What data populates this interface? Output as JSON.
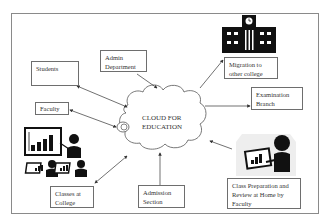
{
  "diagram": {
    "center": {
      "label_line1": "CLOUD FOR",
      "label_line2": "EDUCATION"
    },
    "nodes": {
      "students": {
        "label": "Students"
      },
      "admin": {
        "line1": "Admin",
        "line2": "Department"
      },
      "faculty": {
        "label": "Faculty"
      },
      "migration": {
        "line1": "Migration to",
        "line2": "other college"
      },
      "examination": {
        "line1": "Examination",
        "line2": "Branch"
      },
      "classes": {
        "line1": "Classes at",
        "line2": "College"
      },
      "admission": {
        "line1": "Admission",
        "line2": "Section"
      },
      "home": {
        "line1": "Class Preparation and",
        "line2": "Review at Home by",
        "line3": "Faculty"
      }
    },
    "colors": {
      "line": "#333333",
      "border": "#6e6e6e",
      "icon": "#111111",
      "shadow": "#e9e9e9"
    }
  }
}
